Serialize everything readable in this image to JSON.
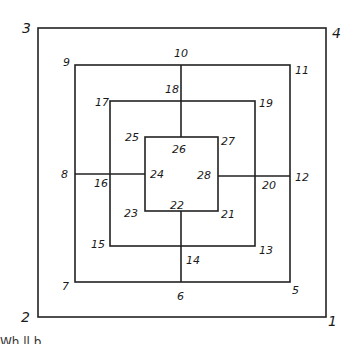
{
  "diagram": {
    "title": "",
    "colors": {
      "line": "#222222",
      "text": "#1a1a1a",
      "background": "#ffffff"
    },
    "squares": [
      {
        "id": "outer",
        "corners": {
          "top_left": "3",
          "top_right": "4",
          "bottom_right": "1",
          "bottom_left": "2"
        }
      },
      {
        "id": "second",
        "corners": {
          "top_left": "9",
          "top_right": "11",
          "bottom_right": "5",
          "bottom_left": "7"
        },
        "midpoints": {
          "top": "10",
          "right": "12",
          "bottom": "6",
          "left": "8"
        }
      },
      {
        "id": "third",
        "corners": {
          "top_left": "17",
          "top_right": "19",
          "bottom_right": "13",
          "bottom_left": "15"
        },
        "midpoints": {
          "top": "18",
          "right": "20",
          "bottom": "14",
          "left": "16"
        }
      },
      {
        "id": "inner",
        "corners": {
          "top_left": "25",
          "top_right": "27",
          "bottom_right": "21",
          "bottom_left": "23"
        },
        "midpoints": {
          "top": "26",
          "right": "28",
          "bottom": "22",
          "left": "24"
        }
      }
    ],
    "labels": {
      "n1": "1",
      "n2": "2",
      "n3": "3",
      "n4": "4",
      "n5": "5",
      "n6": "6",
      "n7": "7",
      "n8": "8",
      "n9": "9",
      "n10": "10",
      "n11": "11",
      "n12": "12",
      "n13": "13",
      "n14": "14",
      "n15": "15",
      "n16": "16",
      "n17": "17",
      "n18": "18",
      "n19": "19",
      "n20": "20",
      "n21": "21",
      "n22": "22",
      "n23": "23",
      "n24": "24",
      "n25": "25",
      "n26": "26",
      "n27": "27",
      "n28": "28"
    },
    "bottom_text_fragment": "Wh    ll  b"
  }
}
